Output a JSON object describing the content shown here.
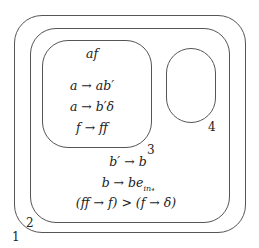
{
  "diagram": {
    "membranes": [
      {
        "id": "1",
        "label": "1"
      },
      {
        "id": "2",
        "label": "2"
      },
      {
        "id": "3",
        "label": "3",
        "contents": [
          "af"
        ],
        "rules": [
          "a → ab′",
          "a → b′δ",
          "f → ff"
        ]
      },
      {
        "id": "4",
        "label": "4"
      }
    ],
    "membrane3": {
      "object": "af",
      "rule1": "a → ab′",
      "rule2": "a → b′δ",
      "rule3": "f → ff"
    },
    "membrane2": {
      "rule1": "b′ → b",
      "rule2_main": "b → be",
      "rule2_sub": "in₄",
      "priority": "(ff → f) > (f → δ)"
    },
    "labels": {
      "m1": "1",
      "m2": "2",
      "m3": "3",
      "m4": "4"
    }
  }
}
